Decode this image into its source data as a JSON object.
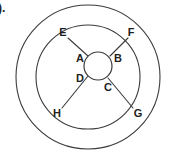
{
  "figure": {
    "item_number": ").",
    "geometry": {
      "center_x": 88,
      "center_y": 77,
      "outer_radius": 72,
      "middle_radius": 52,
      "inner_radius": 14,
      "inner_center_x": 98,
      "inner_center_y": 66
    },
    "colors": {
      "stroke": "#3b3b3b",
      "label": "#231f20",
      "background": "#ffffff"
    },
    "labels": [
      {
        "id": "A",
        "text": "A",
        "x": 80,
        "y": 59,
        "role": "inner-upper-left"
      },
      {
        "id": "B",
        "text": "B",
        "x": 118,
        "y": 59,
        "role": "inner-upper-right"
      },
      {
        "id": "C",
        "text": "C",
        "x": 108,
        "y": 88,
        "role": "inner-lower-right"
      },
      {
        "id": "D",
        "text": "D",
        "x": 80,
        "y": 79,
        "role": "inner-lower-left"
      },
      {
        "id": "E",
        "text": "E",
        "x": 63,
        "y": 33,
        "role": "outer-upper-left"
      },
      {
        "id": "F",
        "text": "F",
        "x": 131,
        "y": 33,
        "role": "outer-upper-right"
      },
      {
        "id": "G",
        "text": "G",
        "x": 138,
        "y": 114,
        "role": "outer-lower-right"
      },
      {
        "id": "H",
        "text": "H",
        "x": 57,
        "y": 114,
        "role": "outer-lower-left"
      }
    ],
    "spokes": [
      {
        "id": "A-E",
        "from": "A",
        "to": "E",
        "x1": 88,
        "y1": 56,
        "x2": 68,
        "y2": 38
      },
      {
        "id": "B-F",
        "from": "B",
        "to": "F",
        "x1": 110,
        "y1": 56,
        "x2": 128,
        "y2": 38
      },
      {
        "id": "C-G",
        "from": "C",
        "to": "G",
        "x1": 108,
        "y1": 78,
        "x2": 133,
        "y2": 108
      },
      {
        "id": "D-H",
        "from": "D",
        "to": "H",
        "x1": 88,
        "y1": 76,
        "x2": 62,
        "y2": 108
      }
    ]
  }
}
